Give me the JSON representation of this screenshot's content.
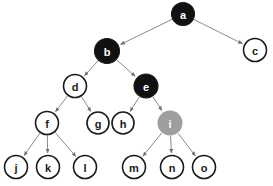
{
  "diagram": {
    "title_sliver": "",
    "type": "tree",
    "canvas": {
      "width": 273,
      "height": 186
    },
    "colors": {
      "black_fill": "#111111",
      "white_fill": "#ffffff",
      "gray_fill": "#9e9e9e",
      "stroke": "#1a1a1a",
      "edge": "#8a8a8a",
      "label_on_dark": "#ffffff",
      "label_on_light": "#1a1a1a",
      "background": "#ffffff"
    },
    "nodes": [
      {
        "id": "a",
        "label": "a",
        "cx": 183,
        "cy": 14,
        "r": 11.5,
        "fill": "black",
        "text": "light"
      },
      {
        "id": "c",
        "label": "c",
        "cx": 255,
        "cy": 50,
        "r": 11.5,
        "fill": "white",
        "text": "dark"
      },
      {
        "id": "b",
        "label": "b",
        "cx": 107,
        "cy": 51,
        "r": 12.5,
        "fill": "black",
        "text": "light"
      },
      {
        "id": "d",
        "label": "d",
        "cx": 75,
        "cy": 86,
        "r": 11.5,
        "fill": "white",
        "text": "dark"
      },
      {
        "id": "e",
        "label": "e",
        "cx": 146,
        "cy": 86,
        "r": 12.0,
        "fill": "black",
        "text": "light"
      },
      {
        "id": "f",
        "label": "f",
        "cx": 47,
        "cy": 123,
        "r": 11.5,
        "fill": "white",
        "text": "dark"
      },
      {
        "id": "g",
        "label": "g",
        "cx": 98,
        "cy": 123,
        "r": 11.0,
        "fill": "white",
        "text": "dark"
      },
      {
        "id": "h",
        "label": "h",
        "cx": 123,
        "cy": 123,
        "r": 11.0,
        "fill": "white",
        "text": "dark"
      },
      {
        "id": "i",
        "label": "i",
        "cx": 170,
        "cy": 123,
        "r": 12.5,
        "fill": "gray",
        "text": "light"
      },
      {
        "id": "j",
        "label": "j",
        "cx": 16,
        "cy": 167,
        "r": 11.5,
        "fill": "white",
        "text": "dark"
      },
      {
        "id": "k",
        "label": "k",
        "cx": 48,
        "cy": 167,
        "r": 11.5,
        "fill": "white",
        "text": "dark"
      },
      {
        "id": "l",
        "label": "l",
        "cx": 85,
        "cy": 167,
        "r": 11.5,
        "fill": "white",
        "text": "dark"
      },
      {
        "id": "m",
        "label": "m",
        "cx": 134,
        "cy": 167,
        "r": 11.5,
        "fill": "white",
        "text": "dark"
      },
      {
        "id": "n",
        "label": "n",
        "cx": 172,
        "cy": 167,
        "r": 11.5,
        "fill": "white",
        "text": "dark"
      },
      {
        "id": "o",
        "label": "o",
        "cx": 204,
        "cy": 167,
        "r": 11.5,
        "fill": "white",
        "text": "dark"
      }
    ],
    "edges": [
      {
        "from": "a",
        "to": "b",
        "directed": true
      },
      {
        "from": "a",
        "to": "c",
        "directed": true
      },
      {
        "from": "b",
        "to": "d",
        "directed": true
      },
      {
        "from": "b",
        "to": "e",
        "directed": true
      },
      {
        "from": "d",
        "to": "f",
        "directed": true
      },
      {
        "from": "d",
        "to": "g",
        "directed": true
      },
      {
        "from": "e",
        "to": "h",
        "directed": true
      },
      {
        "from": "e",
        "to": "i",
        "directed": true
      },
      {
        "from": "f",
        "to": "j",
        "directed": true
      },
      {
        "from": "f",
        "to": "k",
        "directed": true
      },
      {
        "from": "f",
        "to": "l",
        "directed": true
      },
      {
        "from": "i",
        "to": "m",
        "directed": true
      },
      {
        "from": "i",
        "to": "n",
        "directed": true
      },
      {
        "from": "i",
        "to": "o",
        "directed": true
      }
    ]
  }
}
